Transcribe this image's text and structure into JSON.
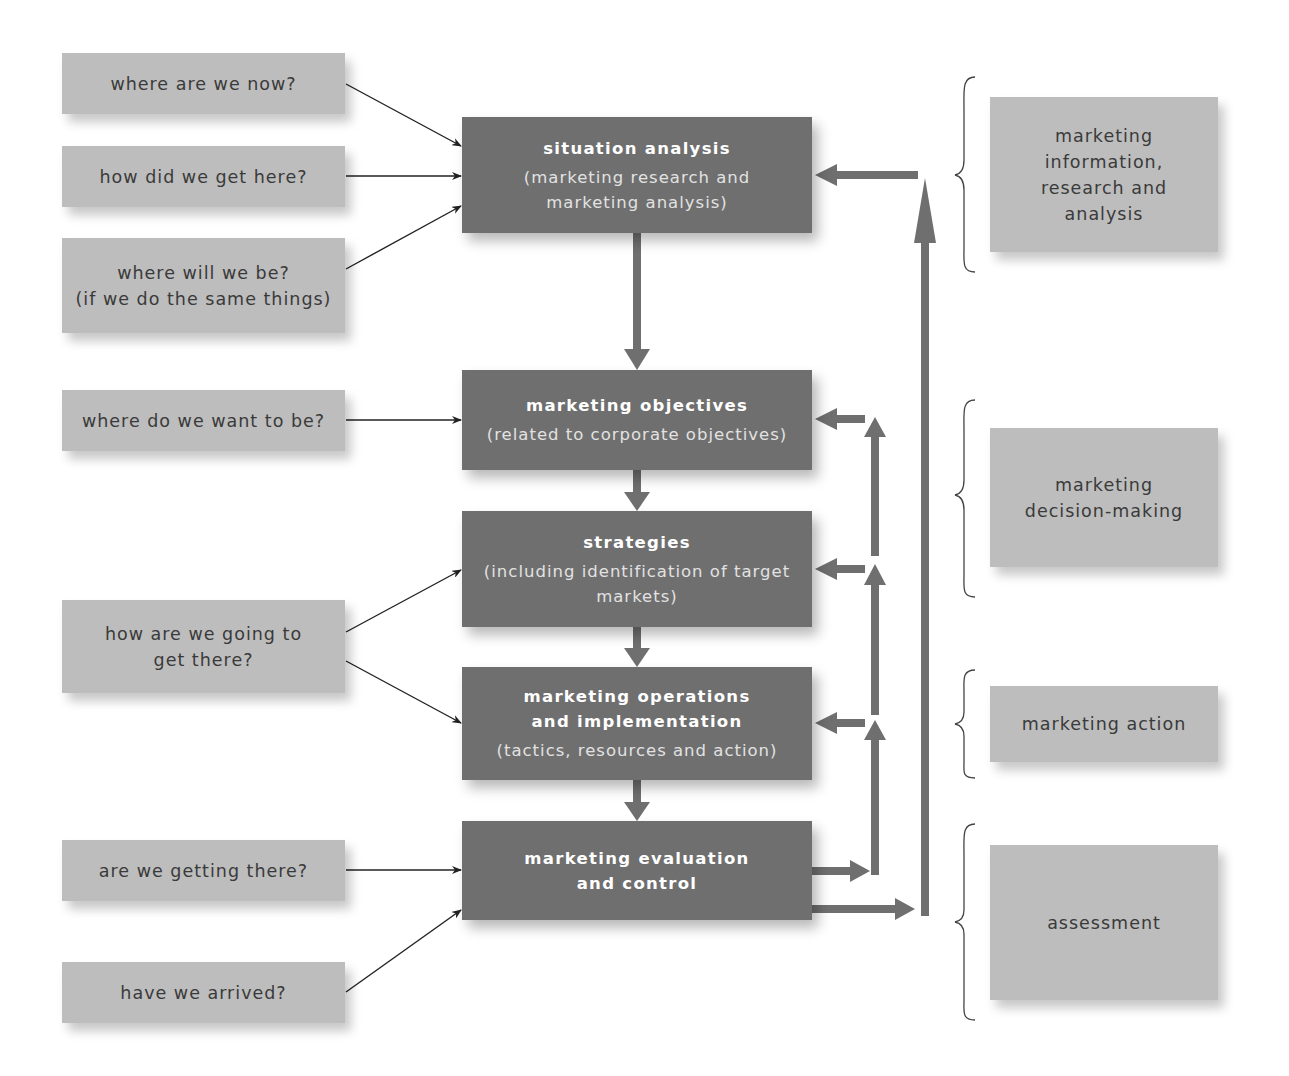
{
  "colors": {
    "question_box": "#bdbdbd",
    "stage_box": "#6f6f6f",
    "category_box": "#bdbdbd",
    "arrow_thick": "#6f6f6f",
    "arrow_thin": "#222222",
    "text_dark": "#3a3a3a",
    "text_light": "#ffffff"
  },
  "questions": [
    {
      "label": "where are we now?"
    },
    {
      "label": "how did we get here?"
    },
    {
      "label": "where will we be?\n(if we do the same things)"
    },
    {
      "label": "where do we want to be?"
    },
    {
      "label": "how are we going to\nget there?"
    },
    {
      "label": "are we getting there?"
    },
    {
      "label": "have we arrived?"
    }
  ],
  "stages": [
    {
      "title": "situation analysis",
      "subtitle": "(marketing research and\nmarketing analysis)"
    },
    {
      "title": "marketing objectives",
      "subtitle": "(related to corporate objectives)"
    },
    {
      "title": "strategies",
      "subtitle": "(including identification of target\nmarkets)"
    },
    {
      "title": "marketing operations\nand implementation",
      "subtitle": "(tactics, resources and action)"
    },
    {
      "title": "marketing evaluation\nand control",
      "subtitle": ""
    }
  ],
  "categories": [
    {
      "label": "marketing\ninformation,\nresearch and\nanalysis"
    },
    {
      "label": "marketing\ndecision-making"
    },
    {
      "label": "marketing action"
    },
    {
      "label": "assessment"
    }
  ]
}
